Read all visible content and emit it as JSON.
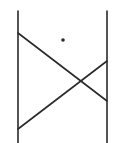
{
  "diagram": {
    "width": 120,
    "height": 143,
    "background": "#ffffff",
    "stroke_color": "#2a2a2a",
    "stroke_width": 1.6,
    "lines": [
      {
        "name": "left-vertical-line",
        "x1": 18,
        "y1": 11,
        "x2": 18,
        "y2": 143
      },
      {
        "name": "right-vertical-line",
        "x1": 107,
        "y1": 11,
        "x2": 107,
        "y2": 143
      },
      {
        "name": "descending-diagonal-line",
        "x1": 18,
        "y1": 33,
        "x2": 107,
        "y2": 101
      },
      {
        "name": "ascending-diagonal-line",
        "x1": 18,
        "y1": 129,
        "x2": 107,
        "y2": 61
      }
    ],
    "dots": [
      {
        "name": "point-dot",
        "cx": 63,
        "cy": 40,
        "r": 1.8
      }
    ]
  }
}
